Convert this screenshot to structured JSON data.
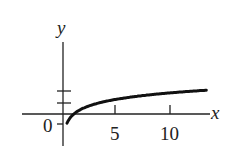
{
  "chart_data": {
    "type": "line",
    "title": "",
    "xlabel": "x",
    "ylabel": "y",
    "function": "y = ln x",
    "x_ticks": [
      5,
      10
    ],
    "x_tick_labels": [
      "5",
      "10"
    ],
    "y_ticks": [
      -1,
      1,
      2
    ],
    "origin_label": "0",
    "xlim": [
      -3.5,
      14
    ],
    "ylim": [
      -2,
      6
    ],
    "series": [
      {
        "name": "ln x",
        "x": [
          0.37,
          0.5,
          1,
          2,
          3,
          4,
          5,
          6,
          7,
          8,
          9,
          10,
          11,
          12,
          13
        ],
        "values": [
          -1.0,
          -0.69,
          0,
          0.69,
          1.1,
          1.39,
          1.61,
          1.79,
          1.95,
          2.08,
          2.2,
          2.3,
          2.4,
          2.48,
          2.56
        ]
      }
    ],
    "color": "#111111"
  },
  "labels": {
    "x_axis": "x",
    "y_axis": "y",
    "origin": "0",
    "tick5": "5",
    "tick10": "10"
  }
}
